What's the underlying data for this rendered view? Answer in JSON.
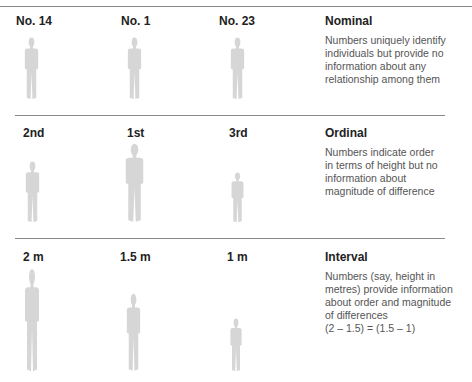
{
  "figure_color": "#d6d6d6",
  "rule_color": "#8a8a8a",
  "rows": [
    {
      "scale": "Nominal",
      "description_lines": [
        "Numbers uniquely identify",
        "individuals but provide no",
        "information about any",
        "relationship among them"
      ],
      "people": [
        {
          "label": "No. 14"
        },
        {
          "label": "No. 1"
        },
        {
          "label": "No. 23"
        }
      ]
    },
    {
      "scale": "Ordinal",
      "description_lines": [
        "Numbers indicate order",
        "in terms of height but no",
        "information about",
        "magnitude of difference"
      ],
      "people": [
        {
          "label": "2nd"
        },
        {
          "label": "1st"
        },
        {
          "label": "3rd"
        }
      ]
    },
    {
      "scale": "Interval",
      "description_lines": [
        "Numbers (say, height in",
        "metres) provide information",
        "about order and magnitude",
        "of differences",
        "(2 – 1.5) = (1.5 – 1)"
      ],
      "people": [
        {
          "label": "2 m"
        },
        {
          "label": "1.5 m"
        },
        {
          "label": "1 m"
        }
      ]
    }
  ]
}
